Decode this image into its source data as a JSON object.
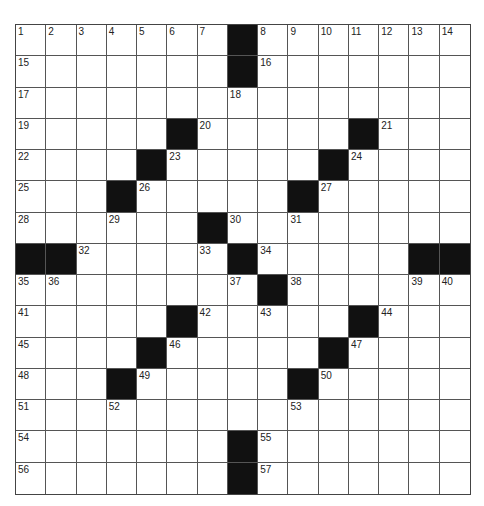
{
  "puzzle": {
    "rows": 15,
    "cols": 15,
    "colors": {
      "block": "#111111",
      "cell": "#ffffff",
      "line": "#555555"
    },
    "layout": [
      "1234567#8901234",
      "1......#1......",
      "1......1.......",
      "1....#1....#1..",
      "1...#1....#1...",
      "1..#1....#1....",
      "1..1..#1.1.....",
      "##1...1#1....##",
      "11.....1#1...11",
      "1....#1.1..#1..",
      "1...#1....#1...",
      "1..#1....#1....",
      "1..1.....1.....",
      "1......#1......",
      "1......#1......"
    ],
    "grid": [
      [
        "1",
        "2",
        "3",
        "4",
        "5",
        "6",
        "7",
        "#",
        "8",
        "9",
        "10",
        "11",
        "12",
        "13",
        "14"
      ],
      [
        "15",
        "",
        "",
        "",
        "",
        "",
        "",
        "#",
        "16",
        "",
        "",
        "",
        "",
        "",
        ""
      ],
      [
        "17",
        "",
        "",
        "",
        "",
        "",
        "",
        "18",
        "",
        "",
        "",
        "",
        "",
        "",
        ""
      ],
      [
        "19",
        "",
        "",
        "",
        "",
        "#",
        "20",
        "",
        "",
        "",
        "",
        "#",
        "21",
        "",
        ""
      ],
      [
        "22",
        "",
        "",
        "",
        "#",
        "23",
        "",
        "",
        "",
        "",
        "#",
        "24",
        "",
        "",
        ""
      ],
      [
        "25",
        "",
        "",
        "#",
        "26",
        "",
        "",
        "",
        "",
        "#",
        "27",
        "",
        "",
        "",
        ""
      ],
      [
        "28",
        "",
        "",
        "29",
        "",
        "",
        "#",
        "30",
        "",
        "31",
        "",
        "",
        "",
        "",
        ""
      ],
      [
        "#",
        "#",
        "32",
        "",
        "",
        "",
        "33",
        "#",
        "34",
        "",
        "",
        "",
        "",
        "#",
        "#"
      ],
      [
        "35",
        "36",
        "",
        "",
        "",
        "",
        "",
        "37",
        "#",
        "38",
        "",
        "",
        "",
        "39",
        "40"
      ],
      [
        "41",
        "",
        "",
        "",
        "",
        "#",
        "42",
        "",
        "43",
        "",
        "",
        "#",
        "44",
        "",
        ""
      ],
      [
        "45",
        "",
        "",
        "",
        "#",
        "46",
        "",
        "",
        "",
        "",
        "#",
        "47",
        "",
        "",
        ""
      ],
      [
        "48",
        "",
        "",
        "#",
        "49",
        "",
        "",
        "",
        "",
        "#",
        "50",
        "",
        "",
        "",
        ""
      ],
      [
        "51",
        "",
        "",
        "52",
        "",
        "",
        "",
        "",
        "",
        "53",
        "",
        "",
        "",
        "",
        ""
      ],
      [
        "54",
        "",
        "",
        "",
        "",
        "",
        "",
        "#",
        "55",
        "",
        "",
        "",
        "",
        "",
        ""
      ],
      [
        "56",
        "",
        "",
        "",
        "",
        "",
        "",
        "#",
        "57",
        "",
        "",
        "",
        "",
        "",
        ""
      ]
    ]
  }
}
